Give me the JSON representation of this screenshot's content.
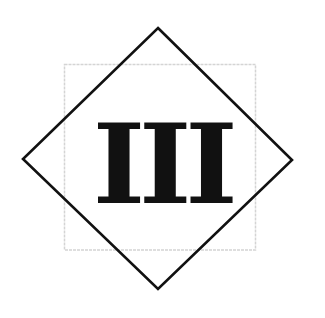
{
  "figure": {
    "numeral_text": "III",
    "numeral_meaning": "roman-numeral-three",
    "colors": {
      "background": "#ffffff",
      "diamond_stroke": "#111111",
      "square_stroke": "#d4d4d4",
      "numeral": "#111111"
    },
    "diamond": {
      "top": [
        158,
        28
      ],
      "right": [
        292,
        160
      ],
      "bottom": [
        158,
        289
      ],
      "left": [
        23,
        159
      ]
    },
    "square": {
      "x": 64,
      "y": 64,
      "width": 192,
      "height": 186
    }
  }
}
